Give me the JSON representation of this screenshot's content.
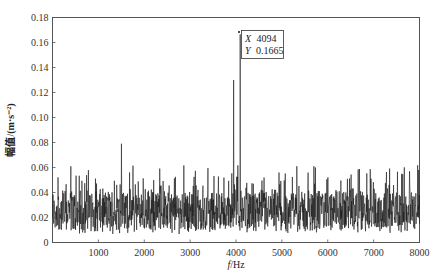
{
  "chart_data": {
    "type": "line",
    "title": "",
    "xlabel": "f/Hz",
    "xlabel_italic": "f",
    "xlabel_unit": "/Hz",
    "ylabel": "幅值/(m·s⁻²)",
    "xlim": [
      0,
      8000
    ],
    "ylim": [
      0,
      0.18
    ],
    "x_ticks": [
      1000,
      2000,
      3000,
      4000,
      5000,
      6000,
      7000,
      8000
    ],
    "x_tick_labels": [
      "1000",
      "2000",
      "3000",
      "4000",
      "5000",
      "6000",
      "7000",
      "8000"
    ],
    "y_ticks": [
      0,
      0.02,
      0.04,
      0.06,
      0.08,
      0.1,
      0.12,
      0.14,
      0.16,
      0.18
    ],
    "y_tick_labels": [
      "0",
      "0.02",
      "0.04",
      "0.06",
      "0.08",
      "0.10",
      "0.12",
      "0.14",
      "0.16",
      "0.18"
    ],
    "grid": false,
    "legend": null,
    "series": [
      {
        "name": "amplitude spectrum",
        "color": "#1a1a1a",
        "description": "Dense noisy spectrum, baseline ~0.005-0.06 m/s^2 across 0-8000 Hz, mean ~0.025",
        "baseline_mean": 0.025,
        "baseline_range": [
          0.003,
          0.062
        ],
        "notable_peaks": [
          {
            "x": 1500,
            "y": 0.079
          },
          {
            "x": 3950,
            "y": 0.13
          },
          {
            "x": 4094,
            "y": 0.1665
          },
          {
            "x": 7980,
            "y": 0.058
          }
        ]
      }
    ],
    "annotations": [
      {
        "type": "datatip",
        "x": 4094,
        "y": 0.1665,
        "x_label": "X",
        "x_value": "4094",
        "y_label": "Y",
        "y_value": "0.1665"
      }
    ]
  },
  "datatip": {
    "x_label": "X",
    "x_value": "4094",
    "y_label": "Y",
    "y_value": "0.1665"
  }
}
